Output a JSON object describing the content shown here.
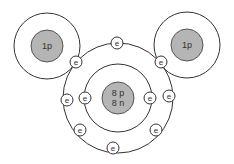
{
  "diagram": {
    "colors": {
      "background": "#ffffff",
      "line": "#333333",
      "nucleus_fill": "#b5b5b5"
    },
    "hydrogen_left": {
      "nucleus_label": "1p",
      "cx": 47,
      "cy": 46,
      "shell_r": 33,
      "nucleus_r": 16
    },
    "hydrogen_right": {
      "nucleus_label": "1p",
      "cx": 187,
      "cy": 45,
      "shell_r": 33,
      "nucleus_r": 16
    },
    "oxygen": {
      "nucleus_label_line1": "8 p",
      "nucleus_label_line2": "8 n",
      "cx": 118,
      "cy": 98,
      "outer_shell_r": 55,
      "inner_shell_r": 34,
      "nucleus_r": 16
    },
    "electron_label": "e",
    "electrons": [
      {
        "id": "top",
        "x": 117,
        "y": 43
      },
      {
        "id": "shared-left",
        "x": 76,
        "y": 62
      },
      {
        "id": "shared-right",
        "x": 161,
        "y": 62
      },
      {
        "id": "outer-left",
        "x": 67,
        "y": 100
      },
      {
        "id": "inner-left",
        "x": 85,
        "y": 98
      },
      {
        "id": "inner-right",
        "x": 150,
        "y": 98
      },
      {
        "id": "outer-right",
        "x": 169,
        "y": 96
      },
      {
        "id": "lower-left",
        "x": 80,
        "y": 130
      },
      {
        "id": "lower-right",
        "x": 156,
        "y": 130
      },
      {
        "id": "bottom",
        "x": 113,
        "y": 148
      }
    ]
  }
}
